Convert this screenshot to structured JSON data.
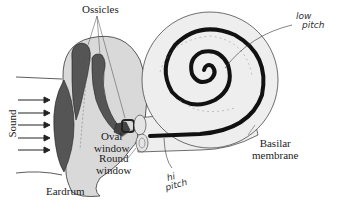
{
  "diagram": {
    "labels": {
      "ossicles": "Ossicles",
      "sound": "Sound",
      "oval_window_line1": "Oval",
      "oval_window_line2": "window",
      "round_window_line1": "Round",
      "round_window_line2": "window",
      "eardrum": "Eardrum",
      "basilar_line1": "Basilar",
      "basilar_line2": "membrane"
    },
    "annotations": {
      "low_pitch_line1": "low",
      "low_pitch_line2": "pitch",
      "hi_pitch_line1": "hi",
      "hi_pitch_line2": "pitch"
    },
    "colors": {
      "middle_ear_fill": "#d9d9d9",
      "bone_fill": "#555555",
      "cochlea_fill": "#eeeeee",
      "membrane": "#111111",
      "outline": "#333333"
    }
  }
}
